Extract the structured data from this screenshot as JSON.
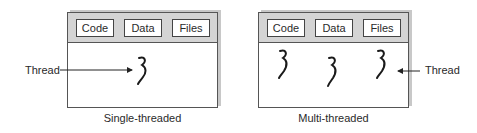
{
  "diagrams": [
    {
      "caption": "Single-threaded",
      "segments": [
        "Code",
        "Data",
        "Files"
      ],
      "thread_label": "Thread",
      "thread_count": 1
    },
    {
      "caption": "Multi-threaded",
      "segments": [
        "Code",
        "Data",
        "Files"
      ],
      "thread_label": "Thread",
      "thread_count": 3
    }
  ],
  "colors": {
    "header": "#d4d4d4",
    "border": "#555555",
    "shadow": "#c8c8c8",
    "thread": "#1a1a1a"
  }
}
